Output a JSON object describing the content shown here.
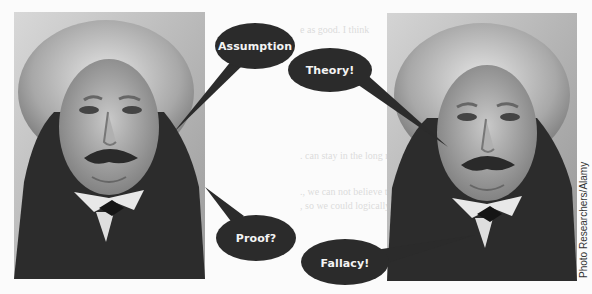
{
  "figure": {
    "left_photo": {
      "alt": "Portrait of Albert Einstein (left)"
    },
    "right_photo": {
      "alt": "Portrait of Albert Einstein (right)"
    },
    "bubbles": [
      {
        "id": "assumption",
        "label": "Assumption"
      },
      {
        "id": "theory",
        "label": "Theory!"
      },
      {
        "id": "proof",
        "label": "Proof?"
      },
      {
        "id": "fallacy",
        "label": "Fallacy!"
      }
    ],
    "bubble_color": "#2b2b2b",
    "bubble_text_color": "#f4f4f4",
    "credit": "Photo Researchers/Alamy"
  }
}
